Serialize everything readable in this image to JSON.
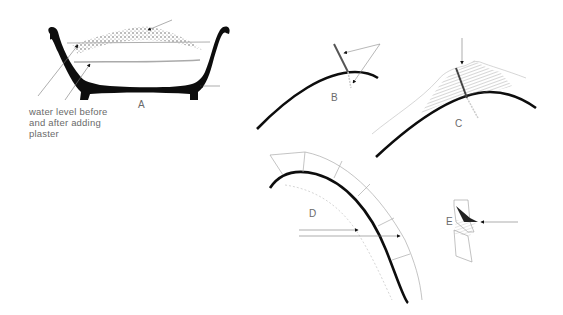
{
  "figure": {
    "panels": [
      {
        "id": "A",
        "label": "A",
        "description": "Cross-section of bowl with water and plaster layer"
      },
      {
        "id": "B",
        "label": "B",
        "description": "Curved surface with cutting line"
      },
      {
        "id": "C",
        "label": "C",
        "description": "Curved surface with hatched plaster mound and cut line"
      },
      {
        "id": "D",
        "label": "D",
        "description": "Arc with segmented outer mould sections"
      },
      {
        "id": "E",
        "label": "E",
        "description": "Joint detail with shaded notch"
      }
    ],
    "annotations": {
      "water_level": "water level before and after adding plaster",
      "water_level_lines": [
        "water level before",
        "and after adding",
        "plaster"
      ]
    }
  }
}
